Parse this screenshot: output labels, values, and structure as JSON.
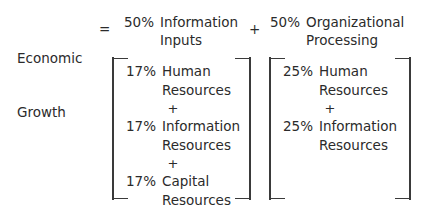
{
  "equation": {
    "left_hand_side": {
      "line1": "Economic",
      "line2": "Growth"
    },
    "equals_sign": "=",
    "plus_sign": "+",
    "terms": [
      {
        "percent": "50%",
        "line1": "Information",
        "line2": "Inputs"
      },
      {
        "percent": "50%",
        "line1": "Organizational",
        "line2": "Processing"
      }
    ]
  },
  "breakdowns": [
    {
      "id": "information-inputs",
      "items": [
        {
          "percent": "17%",
          "line1": "Human",
          "line2": "Resources"
        },
        {
          "percent": "17%",
          "line1": "Information",
          "line2": "Resources"
        },
        {
          "percent": "17%",
          "line1": "Capital",
          "line2": "Resources"
        }
      ],
      "operators": [
        "+",
        "+"
      ]
    },
    {
      "id": "organizational-processing",
      "items": [
        {
          "percent": "25%",
          "line1": "Human",
          "line2": "Resources"
        },
        {
          "percent": "25%",
          "line1": "Information",
          "line2": "Resources"
        }
      ],
      "operators": [
        "+"
      ]
    }
  ],
  "colors": {
    "text": "#2b2b2b",
    "bracket": "#3a3a3a",
    "background": "#ffffff"
  }
}
